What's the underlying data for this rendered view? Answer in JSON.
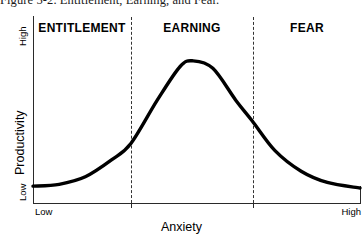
{
  "caption": {
    "number": "Figure 5-2.",
    "text": "Entitlement, Earning, and Fear.",
    "full": "Figure 5-2.  Entitlement, Earning, and Fear."
  },
  "chart_data": {
    "type": "line",
    "title": "Entitlement, Earning, and Fear.",
    "xlabel": "Anxiety",
    "ylabel": "Productivity",
    "grid": false,
    "legend": "none",
    "xticklabels": [
      "Low",
      "High"
    ],
    "yticklabels": [
      "Low",
      "High"
    ],
    "xlim": [
      0,
      100
    ],
    "ylim": [
      0,
      100
    ],
    "annotations": [
      "ENTITLEMENT",
      "EARNING",
      "FEAR"
    ],
    "zones": [
      {
        "label": "ENTITLEMENT",
        "x_start": 0,
        "x_end": 30
      },
      {
        "label": "EARNING",
        "x_start": 30,
        "x_end": 67
      },
      {
        "label": "FEAR",
        "x_start": 67,
        "x_end": 100
      }
    ],
    "dividers": [
      30,
      67
    ],
    "series": [
      {
        "name": "Productivity curve",
        "color": "#000000",
        "x": [
          0,
          8,
          16,
          24,
          30,
          38,
          45,
          49,
          55,
          62,
          67,
          74,
          82,
          90,
          100
        ],
        "y": [
          9,
          10,
          14,
          23,
          32,
          55,
          73,
          76,
          72,
          55,
          44,
          28,
          17,
          11,
          8
        ]
      }
    ]
  },
  "axis": {
    "y_high": "High",
    "y_low": "Low",
    "y_title": "Productivity",
    "x_low": "Low",
    "x_high": "High",
    "x_title": "Anxiety"
  },
  "colors": {
    "curve": "#000000",
    "axis": "#2a2a2a",
    "divider": "#333333",
    "background": "#ffffff"
  }
}
